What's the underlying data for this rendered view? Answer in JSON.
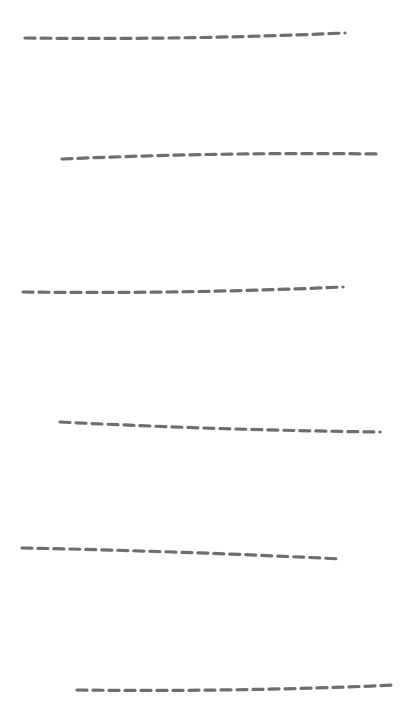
{
  "canvas": {
    "width": 409,
    "height": 702,
    "background": "#ffffff"
  },
  "stroke": {
    "color": "#6e6e6e",
    "width": 3.2,
    "dash": "10 6"
  },
  "lines": [
    {
      "x1": 25,
      "y1": 38,
      "cx": 185,
      "cy": 40,
      "x2": 345,
      "y2": 33
    },
    {
      "x1": 62,
      "y1": 159,
      "cx": 220,
      "cy": 152,
      "x2": 381,
      "y2": 154
    },
    {
      "x1": 23,
      "y1": 292,
      "cx": 183,
      "cy": 294,
      "x2": 343,
      "y2": 287
    },
    {
      "x1": 60,
      "y1": 422,
      "cx": 220,
      "cy": 430,
      "x2": 380,
      "y2": 432
    },
    {
      "x1": 22,
      "y1": 548,
      "cx": 180,
      "cy": 551,
      "x2": 341,
      "y2": 559
    },
    {
      "x1": 77,
      "y1": 690,
      "cx": 237,
      "cy": 692,
      "x2": 396,
      "y2": 685
    }
  ]
}
